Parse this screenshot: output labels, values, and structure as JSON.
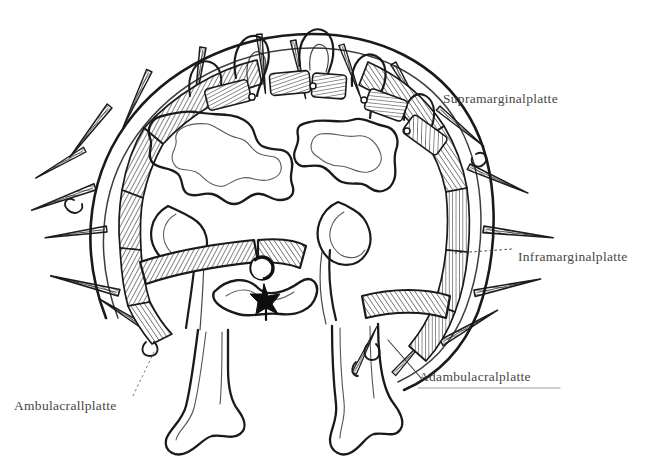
{
  "figure": {
    "style": "antique-line-engraving",
    "background_color": "#ffffff",
    "ink_color": "#1a1a1a",
    "label_color": "#2b2b2b"
  },
  "labels": [
    {
      "id": "supramarginal",
      "text": "Supramarginalplatte",
      "leader": "none",
      "x": 443,
      "y": 91
    },
    {
      "id": "inframarginal",
      "text": "Inframarginalplatte",
      "leader": "dotted",
      "x": 518,
      "y": 249
    },
    {
      "id": "adambulacral",
      "text": "Adambulacralplatte",
      "leader": "line",
      "x": 419,
      "y": 369
    },
    {
      "id": "ambulacral",
      "text": "Ambulacrallplatte",
      "leader": "dotted",
      "x": 14,
      "y": 398
    }
  ],
  "structures": [
    {
      "name": "marginal-plate-ring",
      "description": "hatched ossicle plates forming arched body wall"
    },
    {
      "name": "spines",
      "description": "radiating conical hatched spines",
      "count": 14
    },
    {
      "name": "papulae",
      "description": "looped skin gills between dorsal plates",
      "count": 5
    },
    {
      "name": "pyloric-caeca",
      "description": "branched lobed digestive glands",
      "count": 2
    },
    {
      "name": "radial-water-canal",
      "description": "small circle above nerve cord"
    },
    {
      "name": "radial-nerve-cord",
      "description": "dark star shaped mass at mid-line"
    },
    {
      "name": "ambulacral-ossicles",
      "description": "paired hatched plates forming the arm groove roof"
    },
    {
      "name": "tube-feet",
      "description": "two elongated podia with terminal suckers",
      "count": 2
    }
  ]
}
